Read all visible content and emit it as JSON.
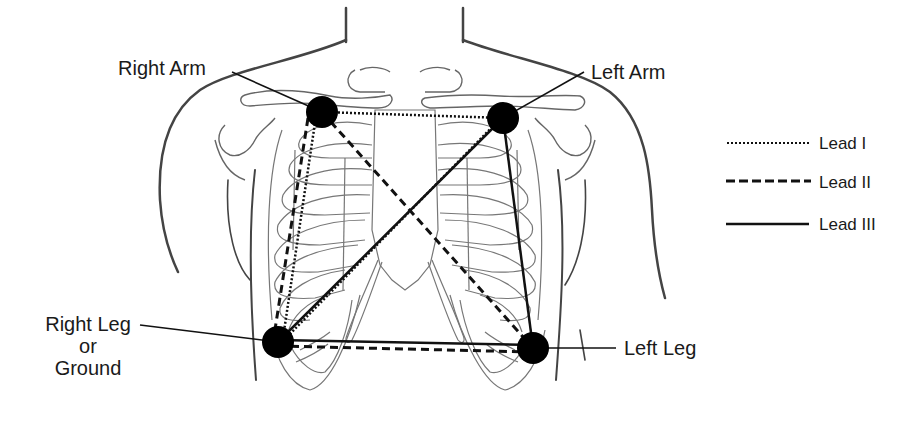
{
  "diagram": {
    "electrodes": [
      {
        "id": "right-arm",
        "label": "Right Arm",
        "x": 322,
        "y": 112
      },
      {
        "id": "left-arm",
        "label": "Left Arm",
        "x": 503,
        "y": 118
      },
      {
        "id": "right-leg",
        "label_lines": [
          "Right Leg",
          "or",
          "Ground"
        ],
        "x": 278,
        "y": 342
      },
      {
        "id": "left-leg",
        "label": "Left Leg",
        "x": 533,
        "y": 348
      }
    ],
    "leads": [
      {
        "name": "Lead I",
        "style": "dotted"
      },
      {
        "name": "Lead II",
        "style": "dashed"
      },
      {
        "name": "Lead III",
        "style": "solid"
      }
    ]
  },
  "labels": {
    "right_arm": "Right Arm",
    "left_arm": "Left Arm",
    "right_leg_line1": "Right Leg",
    "right_leg_line2": "or",
    "right_leg_line3": "Ground",
    "left_leg": "Left Leg"
  },
  "legend": {
    "items": [
      {
        "label": "Lead I",
        "style": "dotted"
      },
      {
        "label": "Lead II",
        "style": "dashed"
      },
      {
        "label": "Lead III",
        "style": "solid"
      }
    ]
  },
  "colors": {
    "ink": "#1a1a1a",
    "outline": "#555555",
    "background": "#ffffff"
  }
}
